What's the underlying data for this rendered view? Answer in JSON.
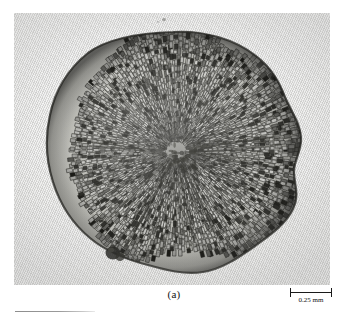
{
  "figure": {
    "caption_label": "(a)",
    "panel_kind": "light-micrograph",
    "background_color": "#e3e3e2",
    "ink_color": "#1a1a1a"
  },
  "scalebar": {
    "label": "0.25 mm",
    "value": "0.25",
    "unit": "mm",
    "bar_length_px": 42
  },
  "footnote": {
    "rule_width_px": 80
  }
}
